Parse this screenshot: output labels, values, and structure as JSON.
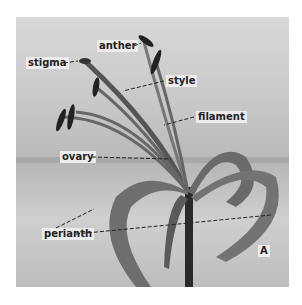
{
  "figure": {
    "panel_letter": "A",
    "labels": [
      {
        "id": "anther",
        "text": "anther"
      },
      {
        "id": "stigma",
        "text": "stigma"
      },
      {
        "id": "style",
        "text": "style"
      },
      {
        "id": "filament",
        "text": "filament"
      },
      {
        "id": "ovary",
        "text": "ovary"
      },
      {
        "id": "perianth",
        "text": "perianth"
      }
    ]
  }
}
